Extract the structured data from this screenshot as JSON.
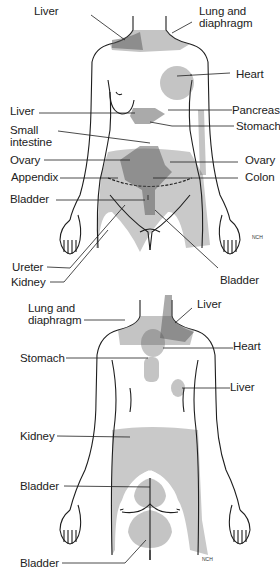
{
  "colors": {
    "shade": "#c9c9c9",
    "line": "#1e1e1e",
    "hatch": "#555555",
    "background": "#ffffff"
  },
  "front_view": {
    "labels": [
      {
        "id": "liver-top",
        "text": "Liver"
      },
      {
        "id": "lung-diaphragm",
        "text": "Lung and\ndiaphragm"
      },
      {
        "id": "heart",
        "text": "Heart"
      },
      {
        "id": "liver-left",
        "text": "Liver"
      },
      {
        "id": "pancreas",
        "text": "Pancreas"
      },
      {
        "id": "small-intestine",
        "text": "Small\nintestine"
      },
      {
        "id": "stomach",
        "text": "Stomach"
      },
      {
        "id": "ovary-left",
        "text": "Ovary"
      },
      {
        "id": "ovary-right",
        "text": "Ovary"
      },
      {
        "id": "appendix",
        "text": "Appendix"
      },
      {
        "id": "colon",
        "text": "Colon"
      },
      {
        "id": "bladder-left",
        "text": "Bladder"
      },
      {
        "id": "ureter",
        "text": "Ureter"
      },
      {
        "id": "kidney",
        "text": "Kidney"
      },
      {
        "id": "bladder-right",
        "text": "Bladder"
      }
    ],
    "signature": "NCH"
  },
  "back_view": {
    "labels": [
      {
        "id": "lung-diaphragm",
        "text": "Lung and\ndiaphragm"
      },
      {
        "id": "liver-top",
        "text": "Liver"
      },
      {
        "id": "heart",
        "text": "Heart"
      },
      {
        "id": "stomach",
        "text": "Stomach"
      },
      {
        "id": "liver-mid",
        "text": "Liver"
      },
      {
        "id": "kidney",
        "text": "Kidney"
      },
      {
        "id": "bladder-mid",
        "text": "Bladder"
      },
      {
        "id": "bladder-bottom",
        "text": "Bladder"
      }
    ],
    "signature": "NCH"
  }
}
